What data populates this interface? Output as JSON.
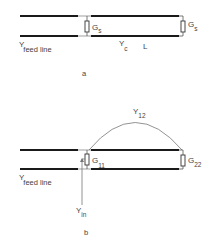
{
  "colors": {
    "line": "#1a1a1a",
    "thin": "#777777",
    "text": "#444444"
  },
  "part_a": {
    "caption": "a",
    "feed_label_main": "Y",
    "feed_label_sub": "feed line",
    "resistor_left_main": "G",
    "resistor_left_sub": "s",
    "resistor_right_main": "G",
    "resistor_right_sub": "s",
    "line_admittance_main": "Y",
    "line_admittance_sub": "c",
    "length_label": "L"
  },
  "part_b": {
    "caption": "b",
    "feed_label_main": "Y",
    "feed_label_sub": "feed line",
    "resistor_left_main": "G",
    "resistor_left_sub": "11",
    "resistor_right_main": "G",
    "resistor_right_sub": "22",
    "mutual_main": "Y",
    "mutual_sub": "12",
    "input_main": "Y",
    "input_sub": "in"
  }
}
